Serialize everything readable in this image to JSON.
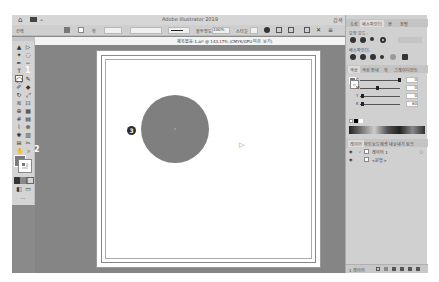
{
  "app": {
    "title": "Adobe Illustrator 2019",
    "search_label": "검색"
  },
  "control_bar": {
    "selection_label": "선택",
    "stroke_label": "획",
    "stroke_weight": "1pt",
    "style_label": "불투명도",
    "opacity_value": "100%",
    "style_value": "스타일"
  },
  "document": {
    "tab_title": "제목없음-1.ai* @ 143.17% (CMYK/GPU 미리 보기)"
  },
  "toolbar": {
    "tools": [
      {
        "name": "selection-tool",
        "glyph": "▲"
      },
      {
        "name": "direct-selection-tool",
        "glyph": "▷"
      },
      {
        "name": "magic-wand-tool",
        "glyph": "✦"
      },
      {
        "name": "lasso-tool",
        "glyph": "◌"
      },
      {
        "name": "pen-tool",
        "glyph": "✒"
      },
      {
        "name": "curvature-tool",
        "glyph": "∽"
      },
      {
        "name": "type-tool",
        "glyph": "T"
      },
      {
        "name": "line-tool",
        "glyph": "/"
      },
      {
        "name": "ellipse-tool",
        "glyph": "◯"
      },
      {
        "name": "paintbrush-tool",
        "glyph": "✎"
      },
      {
        "name": "shaper-tool",
        "glyph": "✐"
      },
      {
        "name": "eraser-tool",
        "glyph": "◆"
      },
      {
        "name": "rotate-tool",
        "glyph": "↻"
      },
      {
        "name": "scale-tool",
        "glyph": "⤢"
      },
      {
        "name": "width-tool",
        "glyph": "≋"
      },
      {
        "name": "free-transform-tool",
        "glyph": "⊡"
      },
      {
        "name": "shape-builder-tool",
        "glyph": "⊕"
      },
      {
        "name": "perspective-grid-tool",
        "glyph": "▦"
      },
      {
        "name": "mesh-tool",
        "glyph": "#"
      },
      {
        "name": "gradient-tool",
        "glyph": "▤"
      },
      {
        "name": "eyedropper-tool",
        "glyph": "⌇"
      },
      {
        "name": "blend-tool",
        "glyph": "⊗"
      },
      {
        "name": "symbol-sprayer-tool",
        "glyph": "✺"
      },
      {
        "name": "column-graph-tool",
        "glyph": "▥"
      },
      {
        "name": "artboard-tool",
        "glyph": "⊞"
      },
      {
        "name": "slice-tool",
        "glyph": "✂"
      },
      {
        "name": "hand-tool",
        "glyph": "✋"
      },
      {
        "name": "zoom-tool",
        "glyph": "⌕"
      }
    ],
    "fill_color": "#7a7a7a",
    "stroke_color": "#ffffff",
    "edit_toolbar_label": "···"
  },
  "canvas": {
    "shape": {
      "type": "circle",
      "fill": "#7f7f7f"
    }
  },
  "callouts": [
    {
      "id": "1",
      "label": "1"
    },
    {
      "id": "2",
      "label": "2"
    },
    {
      "id": "3",
      "label": "3"
    }
  ],
  "right_panel": {
    "tabs": [
      {
        "label": "속성",
        "active": false
      },
      {
        "label": "패스파인더",
        "active": true
      },
      {
        "label": "변",
        "active": false
      },
      {
        "label": "정렬",
        "active": false
      }
    ],
    "shape_modes_label": "모양 모드:",
    "pathfinders_label": "패스파인더:",
    "color_tabs": [
      {
        "label": "색상",
        "active": true
      },
      {
        "label": "색상 안내",
        "active": false
      },
      {
        "label": "획",
        "active": false
      },
      {
        "label": "그레이디언트",
        "active": false
      }
    ],
    "color_sliders": [
      {
        "label": "C",
        "value": "0",
        "thumb": 0.95
      },
      {
        "label": "M",
        "value": "0",
        "thumb": 0.4
      },
      {
        "label": "Y",
        "value": "0",
        "thumb": 0.05
      },
      {
        "label": "K",
        "value": "60",
        "thumb": 0.05
      }
    ],
    "layers_tabs": [
      {
        "label": "레이어",
        "active": true
      },
      {
        "label": "아트보드",
        "active": false
      },
      {
        "label": "에셋 내보내기",
        "active": false
      },
      {
        "label": "링크",
        "active": false
      }
    ],
    "layers": [
      {
        "name": "레이어 1",
        "expanded": true
      },
      {
        "name": "<원형>",
        "expanded": false
      }
    ],
    "layer_count": "1 레이어"
  }
}
